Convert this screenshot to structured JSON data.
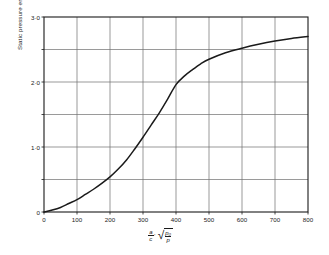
{
  "chart_data": {
    "type": "line",
    "title": "",
    "xlabel": "(a/c)' sqrt(p0/p)",
    "ylabel": "Static pressure error dP/q",
    "xlim": [
      0,
      800
    ],
    "ylim": [
      0,
      3.0
    ],
    "grid": true,
    "legend": "none",
    "x_ticks": [
      0,
      100,
      200,
      300,
      400,
      500,
      600,
      700,
      800
    ],
    "x_tick_labels": [
      "0",
      "100",
      "200",
      "300",
      "400",
      "500",
      "600",
      "700",
      "800"
    ],
    "y_ticks": [
      0,
      0.5,
      1.0,
      1.5,
      2.0,
      2.5,
      3.0
    ],
    "y_tick_labels": [
      "0",
      "",
      "1·0",
      "",
      "2·0",
      "",
      "3·0"
    ],
    "y_minor_gridlines": [
      0.5,
      1.5,
      2.5
    ],
    "series": [
      {
        "name": "static pressure error",
        "color": "#1a1a1a",
        "x": [
          0,
          25,
          50,
          75,
          100,
          125,
          150,
          175,
          200,
          225,
          250,
          275,
          300,
          325,
          350,
          375,
          400,
          425,
          450,
          475,
          500,
          550,
          600,
          650,
          700,
          750,
          800
        ],
        "y": [
          0.0,
          0.03,
          0.07,
          0.13,
          0.19,
          0.27,
          0.35,
          0.44,
          0.54,
          0.66,
          0.8,
          0.97,
          1.15,
          1.34,
          1.53,
          1.74,
          1.96,
          2.09,
          2.19,
          2.28,
          2.35,
          2.45,
          2.52,
          2.58,
          2.63,
          2.67,
          2.7
        ]
      }
    ]
  },
  "axis": {
    "y_title_text": "Static pressure error",
    "y_title_frac_num": "ΔP",
    "y_title_frac_den": "q",
    "x_title_frac_num": "a",
    "x_title_frac_den": "c",
    "x_title_prime": "′",
    "x_title_radical_num": "p₀",
    "x_title_radical_den": "p"
  },
  "colors": {
    "curve": "#1a1a1a",
    "grid": "#6f6f6f",
    "axis": "#1a1a1a",
    "background": "#ffffff"
  }
}
